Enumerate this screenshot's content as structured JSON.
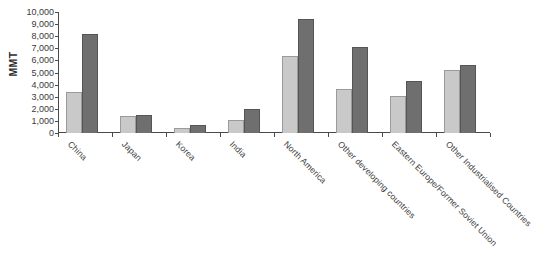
{
  "chart_data": {
    "type": "bar",
    "title": "",
    "xlabel": "",
    "ylabel": "MMT",
    "ylim": [
      0,
      10000
    ],
    "ytick_labels": [
      "10,000",
      "9,000",
      "8,000",
      "7,000",
      "6,000",
      "5,000",
      "4,000",
      "3,000",
      "2,000",
      "1,000",
      "0"
    ],
    "ytick_values": [
      10000,
      9000,
      8000,
      7000,
      6000,
      5000,
      4000,
      3000,
      2000,
      1000,
      0
    ],
    "grid": false,
    "legend": "none",
    "categories": [
      "China",
      "Japan",
      "Korea",
      "India",
      "North America",
      "Other developing countries",
      "Eastern Europe/Former Soviet Union",
      "Other Industrialised Countries"
    ],
    "series": [
      {
        "name": "Series 1",
        "color": "#c9c9c9",
        "values": [
          3350,
          1400,
          450,
          1050,
          6400,
          3600,
          3050,
          5200
        ]
      },
      {
        "name": "Series 2",
        "color": "#6f6f6f",
        "values": [
          8150,
          1450,
          700,
          2000,
          9400,
          7150,
          4300,
          5650
        ]
      }
    ]
  },
  "colors": {
    "light_bar": "#c9c9c9",
    "light_bar_border": "#9a9a9a",
    "dark_bar": "#6f6f6f",
    "dark_bar_border": "#555555",
    "axis": "#4a4a4a",
    "text": "#3a3a3a",
    "background": "#ffffff"
  }
}
